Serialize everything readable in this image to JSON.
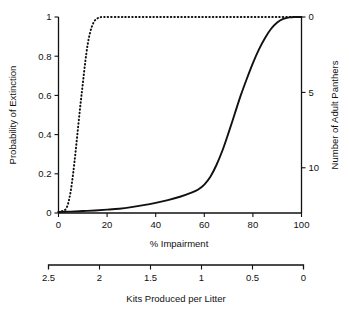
{
  "chart_data": {
    "type": "line",
    "title": "",
    "xlabel": "% Impairment",
    "ylabel": "Probability of Extinction",
    "y2label": "Number of Adult Panthers",
    "secondary_xlabel": "Kits Produced per Litter",
    "xlim": [
      0,
      100
    ],
    "ylim": [
      0,
      1
    ],
    "y2lim": [
      0,
      13
    ],
    "secondary_xlim": [
      2.5,
      0
    ],
    "grid": false,
    "legend": "none",
    "xticks": [
      0,
      20,
      40,
      60,
      80,
      100
    ],
    "xticklabels": [
      "0",
      "20",
      "40",
      "60",
      "80",
      "100"
    ],
    "yticks": [
      0,
      0.2,
      0.4,
      0.6,
      0.8,
      1
    ],
    "yticklabels": [
      "0",
      "0.2",
      "0.4",
      "0.6",
      "0.8",
      "1"
    ],
    "y2ticks": [
      0,
      5,
      10
    ],
    "y2ticklabels": [
      "0",
      "5",
      "10"
    ],
    "secondary_xticks": [
      2.5,
      2,
      1.5,
      1,
      0.5,
      0
    ],
    "secondary_xticklabels": [
      "2.5",
      "2",
      "1.5",
      "1",
      "0.5",
      "0"
    ],
    "series": [
      {
        "name": "Number of Adult Panthers",
        "style": "dotted",
        "axis": "right",
        "x": [
          0,
          1,
          2,
          3,
          4,
          5,
          6,
          7,
          8,
          9,
          10,
          11,
          12,
          13,
          14,
          15,
          16,
          17,
          18,
          20,
          25,
          30,
          40,
          50,
          60,
          70,
          80,
          90,
          100
        ],
        "values": [
          0.005,
          0.008,
          0.012,
          0.02,
          0.05,
          0.11,
          0.2,
          0.31,
          0.43,
          0.55,
          0.66,
          0.77,
          0.86,
          0.92,
          0.96,
          0.983,
          0.993,
          0.998,
          1.0,
          1.0,
          1.0,
          1.0,
          1.0,
          1.0,
          1.0,
          1.0,
          1.0,
          1.0,
          1.0
        ]
      },
      {
        "name": "Probability of Extinction",
        "style": "solid",
        "axis": "left",
        "x": [
          0,
          5,
          10,
          15,
          20,
          25,
          30,
          35,
          40,
          45,
          50,
          55,
          57.5,
          60,
          62.5,
          65,
          67.5,
          70,
          72.5,
          75,
          77.5,
          80,
          82.5,
          85,
          87.5,
          90,
          92.5,
          95,
          97.5,
          100
        ],
        "values": [
          0.005,
          0.007,
          0.01,
          0.013,
          0.017,
          0.022,
          0.03,
          0.04,
          0.052,
          0.066,
          0.083,
          0.105,
          0.12,
          0.145,
          0.185,
          0.245,
          0.32,
          0.41,
          0.505,
          0.6,
          0.685,
          0.765,
          0.835,
          0.893,
          0.94,
          0.972,
          0.99,
          0.998,
          1.0,
          1.0
        ]
      }
    ]
  },
  "labels": {
    "y_axis_title": "Probability of Extinction",
    "y2_axis_title": "Number of Adult Panthers",
    "x_axis_title": "% Impairment",
    "secondary_x_axis_title": "Kits Produced per Litter"
  },
  "colors": {
    "ink": "#111111",
    "background": "#ffffff"
  }
}
